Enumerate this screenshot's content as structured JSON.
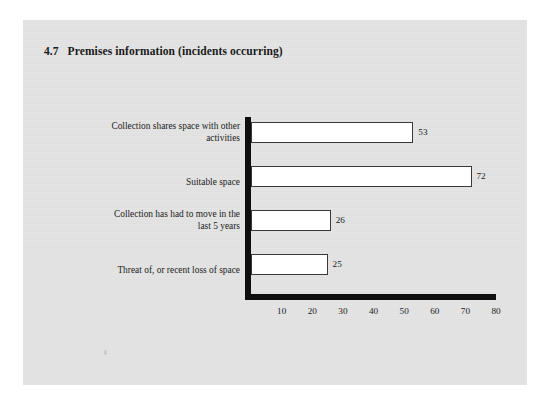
{
  "page": {
    "background_color": "#ffffff",
    "panel_color": "#e3e3e3"
  },
  "chart_data": {
    "type": "bar",
    "orientation": "horizontal",
    "title": "4.7   Premises information (incidents occurring)",
    "section_number": "4.7",
    "title_text": "Premises information (incidents occurring)",
    "categories": [
      "Collection shares space with other activities",
      "Suitable space",
      "Collection has had to move in the last 5 years",
      "Threat of, or recent loss of space"
    ],
    "values": [
      53,
      72,
      26,
      25
    ],
    "data_labels": [
      "53",
      "72",
      "26",
      "25"
    ],
    "xlabel": "",
    "ylabel": "",
    "xlim": [
      0,
      80
    ],
    "xticks": [
      10,
      20,
      30,
      40,
      50,
      60,
      70,
      80
    ],
    "xtick_labels": [
      "10",
      "20",
      "30",
      "40",
      "50",
      "60",
      "70",
      "80"
    ],
    "grid": false,
    "legend": false,
    "bar_fill_color": "#ffffff",
    "bar_edge_color": "#3a3a3a",
    "axis_color": "#0f0f0f"
  },
  "category_lines": [
    [
      "Collection shares space with other",
      "activities"
    ],
    [
      "Suitable space"
    ],
    [
      "Collection has had to move in the",
      "last 5 years"
    ],
    [
      "Threat of, or recent loss of space"
    ]
  ]
}
